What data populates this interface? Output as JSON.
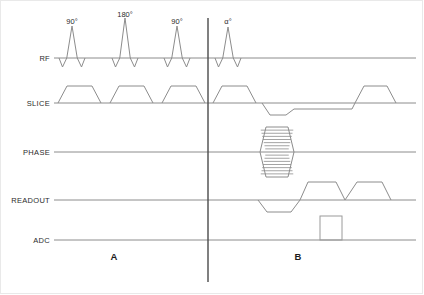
{
  "diagram": {
    "type": "mri-pulse-sequence-timing-diagram",
    "width": 424,
    "height": 295,
    "background_color": "#ffffff",
    "trace_color": "#8c8c8c",
    "divider_color": "#4a4a4a",
    "text_color": "#2b2b2b",
    "border_color": "#e9e9e9"
  },
  "rows": [
    {
      "key": "rf",
      "label": "RF",
      "label_x": 50,
      "baseline": 58,
      "axis_start": 54,
      "axis_end": 416
    },
    {
      "key": "slice",
      "label": "SLICE",
      "label_x": 50,
      "baseline": 103,
      "axis_start": 54,
      "axis_end": 416
    },
    {
      "key": "phase",
      "label": "PHASE",
      "label_x": 50,
      "baseline": 152,
      "axis_start": 54,
      "axis_end": 416
    },
    {
      "key": "readout",
      "label": "READOUT",
      "label_x": 50,
      "baseline": 200,
      "axis_start": 54,
      "axis_end": 416
    },
    {
      "key": "adc",
      "label": "ADC",
      "label_x": 50,
      "baseline": 240,
      "axis_start": 54,
      "axis_end": 416
    }
  ],
  "rf_pulses": [
    {
      "label": "90°",
      "center": 72,
      "label_x": 72,
      "label_y": 24,
      "peak_height": 32,
      "side_lobe": 9,
      "half_width": 5
    },
    {
      "label": "180°",
      "center": 125,
      "label_x": 125,
      "label_y": 17,
      "peak_height": 40,
      "side_lobe": 9,
      "half_width": 5
    },
    {
      "label": "90°",
      "center": 177,
      "label_x": 177,
      "label_y": 24,
      "peak_height": 32,
      "side_lobe": 9,
      "half_width": 5
    },
    {
      "label": "α°",
      "center": 228,
      "label_x": 228,
      "label_y": 24,
      "peak_height": 31,
      "side_lobe": 9,
      "half_width": 5
    }
  ],
  "slice_lobes": [
    {
      "start": 58,
      "end": 101,
      "ramp": 9,
      "amplitude": 17,
      "polarity": "positive"
    },
    {
      "start": 110,
      "end": 153,
      "ramp": 9,
      "amplitude": 17,
      "polarity": "positive"
    },
    {
      "start": 162,
      "end": 205,
      "ramp": 9,
      "amplitude": 17,
      "polarity": "positive"
    },
    {
      "start": 213,
      "end": 256,
      "ramp": 9,
      "amplitude": 17,
      "polarity": "positive"
    },
    {
      "start": 262,
      "end": 294,
      "ramp": 8,
      "amplitude": -12,
      "polarity": "negative"
    },
    {
      "start": 355,
      "end": 396,
      "ramp": 9,
      "amplitude": 17,
      "polarity": "positive"
    }
  ],
  "slice_rephase_step": {
    "start": 294,
    "end": 352,
    "level": -6
  },
  "phase_encode": {
    "center_x": 277,
    "baseline": 152,
    "half_width": 17,
    "ramp": 6,
    "amplitude": 25,
    "ladder_steps": 8,
    "description": "phase-encoding ladder (stacked trapezoid steps, positive and negative)"
  },
  "readout_lobes": [
    {
      "start": 258,
      "end": 300,
      "ramp": 9,
      "amplitude": -12,
      "polarity": "negative"
    },
    {
      "start": 308,
      "end": 345,
      "ramp": 9,
      "amplitude": 18,
      "polarity": "positive"
    },
    {
      "start": 357,
      "end": 391,
      "ramp": 9,
      "amplitude": 18,
      "polarity": "positive"
    }
  ],
  "readout_dip": {
    "start": 345,
    "end": 357,
    "depth": 0
  },
  "adc_window": {
    "start": 320,
    "end": 342,
    "height": 24,
    "label": ""
  },
  "divider": {
    "x": 208,
    "y_top": 18,
    "y_bottom": 282
  },
  "region_labels": [
    {
      "text": "A",
      "x": 114,
      "y": 260
    },
    {
      "text": "B",
      "x": 298,
      "y": 260
    }
  ]
}
